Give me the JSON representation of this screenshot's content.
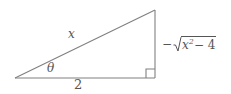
{
  "figure": {
    "type": "right-triangle-trig-diagram",
    "background_color": "#ffffff",
    "stroke_color": "#808080",
    "text_color": "#555555",
    "labels": {
      "hypotenuse": "x",
      "base": "2",
      "angle": "θ",
      "vertical_minus": "−",
      "vertical_radicand_base": "x",
      "vertical_radicand_exponent": "2",
      "vertical_radicand_rest": "− 4",
      "vertical_full": "−√(x² − 4)"
    },
    "geometry": {
      "left_vertex": "15,78",
      "right_vertex": "155,78",
      "apex": "155,10",
      "right_angle_marker": "bottom-right"
    }
  }
}
